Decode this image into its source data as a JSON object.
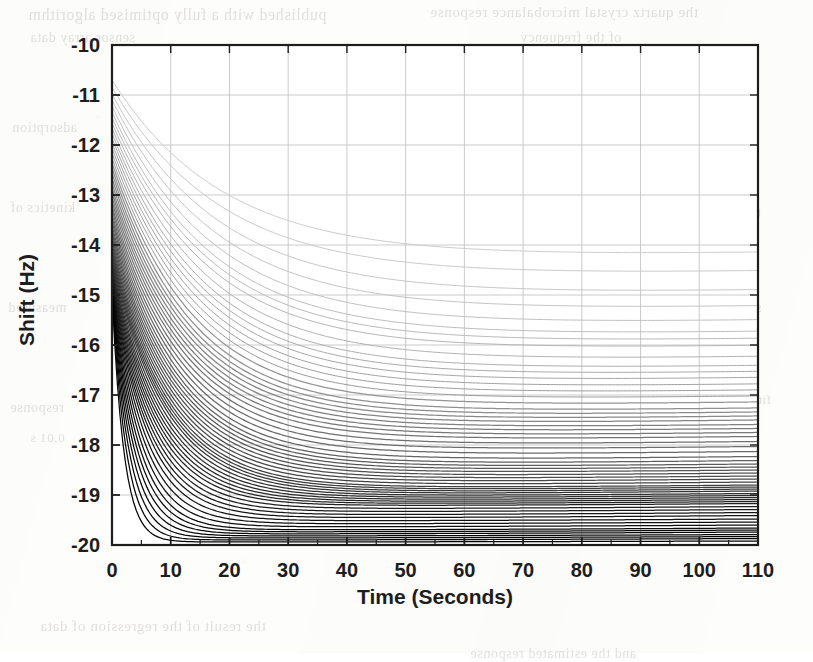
{
  "figure": {
    "title": "",
    "background_page": {
      "description": "scanned page with faint mirrored bleed-through text behind the figure",
      "ghost_lines": [
        {
          "text": "published with a fully optimised algorithm",
          "x": 28,
          "y": 6,
          "size": 16
        },
        {
          "text": "the quartz crystal microbalance response",
          "x": 430,
          "y": 4,
          "size": 15
        },
        {
          "text": "sensor array data",
          "x": 30,
          "y": 30,
          "size": 14
        },
        {
          "text": "of the frequency",
          "x": 520,
          "y": 30,
          "size": 14
        },
        {
          "text": "adsorption",
          "x": 12,
          "y": 120,
          "size": 14
        },
        {
          "text": "constants",
          "x": 690,
          "y": 118,
          "size": 14
        },
        {
          "text": "kinetics of",
          "x": 10,
          "y": 200,
          "size": 14
        },
        {
          "text": "the model",
          "x": 700,
          "y": 205,
          "size": 14
        },
        {
          "text": "measured",
          "x": 8,
          "y": 300,
          "size": 14
        },
        {
          "text": "sensors",
          "x": 716,
          "y": 300,
          "size": 14
        },
        {
          "text": "response",
          "x": 10,
          "y": 400,
          "size": 14
        },
        {
          "text": "0.01 s",
          "x": 30,
          "y": 430,
          "size": 13
        },
        {
          "text": "fitted",
          "x": 740,
          "y": 392,
          "size": 13
        },
        {
          "text": "the result of the regression of data",
          "x": 40,
          "y": 618,
          "size": 15
        },
        {
          "text": "and the estimated response",
          "x": 470,
          "y": 646,
          "size": 14
        }
      ]
    },
    "x_axis": {
      "label": "Time (Seconds)",
      "ticks": [
        0,
        10,
        20,
        30,
        40,
        50,
        60,
        70,
        80,
        90,
        100,
        110
      ],
      "min": 0,
      "max": 110,
      "minor_ticks_per_interval": 1
    },
    "y_axis": {
      "label": "Shift (Hz)",
      "ticks": [
        -10,
        -11,
        -12,
        -13,
        -14,
        -15,
        -16,
        -17,
        -18,
        -19,
        -20
      ],
      "min": -20,
      "max": -10
    },
    "style": {
      "grid": true,
      "grid_color": "#b9b9b9",
      "axis_color": "#1d1d1d",
      "plot_background": "#ffffff"
    }
  },
  "chart_data": {
    "type": "line",
    "title": "",
    "xlabel": "Time (Seconds)",
    "ylabel": "Shift (Hz)",
    "xlim": [
      0,
      110
    ],
    "ylim": [
      -20,
      -10
    ],
    "xticks": [
      0,
      10,
      20,
      30,
      40,
      50,
      60,
      70,
      80,
      90,
      100,
      110
    ],
    "yticks": [
      -10,
      -11,
      -12,
      -13,
      -14,
      -15,
      -16,
      -17,
      -18,
      -19,
      -20
    ],
    "grid": true,
    "legend": "none",
    "annotations": [],
    "model": "y(t) = asymptote + (y0 - asymptote) * exp(-t / tau)",
    "series": [
      {
        "name": "c01",
        "y0": -10.7,
        "asymptote": -14.25,
        "tau": 19.0,
        "end_drift": 0.1,
        "gray": 204
      },
      {
        "name": "c02",
        "y0": -10.84,
        "asymptote": -14.62,
        "tau": 18.6,
        "end_drift": 0.1,
        "gray": 201
      },
      {
        "name": "c03",
        "y0": -10.98,
        "asymptote": -15.0,
        "tau": 18.2,
        "end_drift": 0.1,
        "gray": 198
      },
      {
        "name": "c04",
        "y0": -11.1,
        "asymptote": -15.32,
        "tau": 17.8,
        "end_drift": 0.1,
        "gray": 195
      },
      {
        "name": "c05",
        "y0": -11.22,
        "asymptote": -15.6,
        "tau": 17.4,
        "end_drift": 0.1,
        "gray": 192
      },
      {
        "name": "c06",
        "y0": -11.34,
        "asymptote": -15.82,
        "tau": 17.0,
        "end_drift": 0.09,
        "gray": 188
      },
      {
        "name": "c07",
        "y0": -11.45,
        "asymptote": -15.96,
        "tau": 16.7,
        "end_drift": 0.09,
        "gray": 184
      },
      {
        "name": "c08",
        "y0": -11.56,
        "asymptote": -16.1,
        "tau": 16.4,
        "end_drift": 0.09,
        "gray": 180
      },
      {
        "name": "c09",
        "y0": -11.66,
        "asymptote": -16.32,
        "tau": 16.1,
        "end_drift": 0.09,
        "gray": 176
      },
      {
        "name": "c10",
        "y0": -11.76,
        "asymptote": -16.5,
        "tau": 15.8,
        "end_drift": 0.09,
        "gray": 172
      },
      {
        "name": "c11",
        "y0": -11.86,
        "asymptote": -16.62,
        "tau": 15.5,
        "end_drift": 0.09,
        "gray": 168
      },
      {
        "name": "c12",
        "y0": -11.96,
        "asymptote": -16.74,
        "tau": 15.2,
        "end_drift": 0.09,
        "gray": 164
      },
      {
        "name": "c13",
        "y0": -12.06,
        "asymptote": -16.86,
        "tau": 14.9,
        "end_drift": 0.08,
        "gray": 160
      },
      {
        "name": "c14",
        "y0": -12.16,
        "asymptote": -16.98,
        "tau": 14.6,
        "end_drift": 0.08,
        "gray": 156
      },
      {
        "name": "c15",
        "y0": -12.26,
        "asymptote": -17.1,
        "tau": 14.3,
        "end_drift": 0.08,
        "gray": 152
      },
      {
        "name": "c16",
        "y0": -12.36,
        "asymptote": -17.22,
        "tau": 14.0,
        "end_drift": 0.08,
        "gray": 148
      },
      {
        "name": "c17",
        "y0": -12.46,
        "asymptote": -17.34,
        "tau": 13.7,
        "end_drift": 0.08,
        "gray": 144
      },
      {
        "name": "c18",
        "y0": -12.56,
        "asymptote": -17.42,
        "tau": 13.4,
        "end_drift": 0.08,
        "gray": 140
      },
      {
        "name": "c19",
        "y0": -12.66,
        "asymptote": -17.5,
        "tau": 13.2,
        "end_drift": 0.08,
        "gray": 136
      },
      {
        "name": "c20",
        "y0": -12.76,
        "asymptote": -17.58,
        "tau": 13.0,
        "end_drift": 0.08,
        "gray": 132
      },
      {
        "name": "c21",
        "y0": -12.86,
        "asymptote": -17.66,
        "tau": 12.8,
        "end_drift": 0.07,
        "gray": 128
      },
      {
        "name": "c22",
        "y0": -12.95,
        "asymptote": -17.74,
        "tau": 12.6,
        "end_drift": 0.07,
        "gray": 124
      },
      {
        "name": "c23",
        "y0": -13.04,
        "asymptote": -17.82,
        "tau": 12.4,
        "end_drift": 0.07,
        "gray": 120
      },
      {
        "name": "c24",
        "y0": -13.13,
        "asymptote": -17.9,
        "tau": 12.2,
        "end_drift": 0.07,
        "gray": 116
      },
      {
        "name": "c25",
        "y0": -13.22,
        "asymptote": -18.0,
        "tau": 12.0,
        "end_drift": 0.07,
        "gray": 112
      },
      {
        "name": "c26",
        "y0": -13.3,
        "asymptote": -18.1,
        "tau": 11.8,
        "end_drift": 0.07,
        "gray": 108
      },
      {
        "name": "c27",
        "y0": -13.38,
        "asymptote": -18.2,
        "tau": 11.6,
        "end_drift": 0.07,
        "gray": 104
      },
      {
        "name": "c28",
        "y0": -13.46,
        "asymptote": -18.3,
        "tau": 11.4,
        "end_drift": 0.07,
        "gray": 100
      },
      {
        "name": "c29",
        "y0": -13.54,
        "asymptote": -18.38,
        "tau": 11.2,
        "end_drift": 0.07,
        "gray": 96
      },
      {
        "name": "c30",
        "y0": -13.62,
        "asymptote": -18.44,
        "tau": 11.0,
        "end_drift": 0.06,
        "gray": 92
      },
      {
        "name": "c31",
        "y0": -13.7,
        "asymptote": -18.5,
        "tau": 10.8,
        "end_drift": 0.06,
        "gray": 88
      },
      {
        "name": "c32",
        "y0": -13.77,
        "asymptote": -18.56,
        "tau": 10.6,
        "end_drift": 0.06,
        "gray": 84
      },
      {
        "name": "c33",
        "y0": -13.84,
        "asymptote": -18.62,
        "tau": 10.4,
        "end_drift": 0.06,
        "gray": 80
      },
      {
        "name": "c34",
        "y0": -13.91,
        "asymptote": -18.68,
        "tau": 10.2,
        "end_drift": 0.06,
        "gray": 76
      },
      {
        "name": "c35",
        "y0": -13.98,
        "asymptote": -18.74,
        "tau": 10.0,
        "end_drift": 0.06,
        "gray": 72
      },
      {
        "name": "c36",
        "y0": -14.04,
        "asymptote": -18.8,
        "tau": 9.8,
        "end_drift": 0.06,
        "gray": 68
      },
      {
        "name": "c37",
        "y0": -14.1,
        "asymptote": -18.86,
        "tau": 9.6,
        "end_drift": 0.06,
        "gray": 64
      },
      {
        "name": "c38",
        "y0": -14.16,
        "asymptote": -18.9,
        "tau": 9.4,
        "end_drift": 0.06,
        "gray": 60
      },
      {
        "name": "c39",
        "y0": -14.22,
        "asymptote": -18.94,
        "tau": 9.2,
        "end_drift": 0.06,
        "gray": 56
      },
      {
        "name": "c40",
        "y0": -14.28,
        "asymptote": -18.98,
        "tau": 9.0,
        "end_drift": 0.06,
        "gray": 52
      },
      {
        "name": "c41",
        "y0": -14.34,
        "asymptote": -19.02,
        "tau": 8.7,
        "end_drift": 0.05,
        "gray": 48
      },
      {
        "name": "c42",
        "y0": -14.4,
        "asymptote": -19.06,
        "tau": 8.4,
        "end_drift": 0.05,
        "gray": 45
      },
      {
        "name": "c43",
        "y0": -14.45,
        "asymptote": -19.1,
        "tau": 8.1,
        "end_drift": 0.05,
        "gray": 42
      },
      {
        "name": "c44",
        "y0": -14.5,
        "asymptote": -19.14,
        "tau": 7.8,
        "end_drift": 0.05,
        "gray": 39
      },
      {
        "name": "c45",
        "y0": -14.55,
        "asymptote": -19.18,
        "tau": 7.5,
        "end_drift": 0.05,
        "gray": 36
      },
      {
        "name": "c46",
        "y0": -14.6,
        "asymptote": -19.22,
        "tau": 7.2,
        "end_drift": 0.05,
        "gray": 33
      },
      {
        "name": "c47",
        "y0": -14.64,
        "asymptote": -19.28,
        "tau": 6.9,
        "end_drift": 0.05,
        "gray": 30
      },
      {
        "name": "c48",
        "y0": -14.68,
        "asymptote": -19.34,
        "tau": 6.6,
        "end_drift": 0.05,
        "gray": 27
      },
      {
        "name": "c49",
        "y0": -14.72,
        "asymptote": -19.4,
        "tau": 6.3,
        "end_drift": 0.05,
        "gray": 24
      },
      {
        "name": "c50",
        "y0": -14.76,
        "asymptote": -19.46,
        "tau": 6.0,
        "end_drift": 0.05,
        "gray": 21
      },
      {
        "name": "c51",
        "y0": -14.79,
        "asymptote": -19.52,
        "tau": 5.6,
        "end_drift": 0.04,
        "gray": 18
      },
      {
        "name": "c52",
        "y0": -14.82,
        "asymptote": -19.58,
        "tau": 5.2,
        "end_drift": 0.04,
        "gray": 16
      },
      {
        "name": "c53",
        "y0": -14.85,
        "asymptote": -19.64,
        "tau": 4.8,
        "end_drift": 0.04,
        "gray": 14
      },
      {
        "name": "c54",
        "y0": -14.87,
        "asymptote": -19.7,
        "tau": 4.4,
        "end_drift": 0.04,
        "gray": 12
      },
      {
        "name": "c55",
        "y0": -14.89,
        "asymptote": -19.74,
        "tau": 4.0,
        "end_drift": 0.04,
        "gray": 10
      },
      {
        "name": "c56",
        "y0": -14.9,
        "asymptote": -19.78,
        "tau": 3.6,
        "end_drift": 0.04,
        "gray": 8
      },
      {
        "name": "c57",
        "y0": -14.91,
        "asymptote": -19.82,
        "tau": 3.2,
        "end_drift": 0.03,
        "gray": 6
      },
      {
        "name": "c58",
        "y0": -14.92,
        "asymptote": -19.86,
        "tau": 2.8,
        "end_drift": 0.03,
        "gray": 5
      },
      {
        "name": "c59",
        "y0": -14.93,
        "asymptote": -19.9,
        "tau": 2.4,
        "end_drift": 0.03,
        "gray": 4
      },
      {
        "name": "c60",
        "y0": -14.94,
        "asymptote": -19.94,
        "tau": 2.0,
        "end_drift": 0.02,
        "gray": 3
      }
    ]
  },
  "geometry": {
    "plot_left": 112,
    "plot_right": 758,
    "plot_top": 45,
    "plot_bottom": 545
  }
}
